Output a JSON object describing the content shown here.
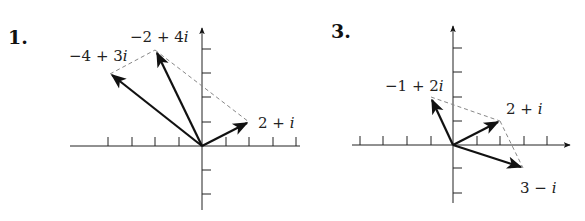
{
  "figures": [
    {
      "number": "1.",
      "origin_px": [
        202,
        146
      ],
      "unit_px": 23.5,
      "x_ticks": [
        -4,
        -3,
        -2,
        -1,
        1,
        2,
        3,
        4
      ],
      "y_ticks": [
        -2,
        -1,
        1,
        2,
        3,
        4
      ],
      "vectors": [
        {
          "re": 2,
          "im": 1,
          "label_main": "2 + ",
          "label_i": "i"
        },
        {
          "re": -4,
          "im": 3,
          "label_main": "−4 + 3",
          "label_i": "i"
        },
        {
          "re": -2,
          "im": 4,
          "label_main": "−2 + 4",
          "label_i": "i"
        }
      ],
      "dashed": [
        [
          [
            -4,
            3
          ],
          [
            -2,
            4
          ]
        ],
        [
          [
            -2,
            4
          ],
          [
            2,
            1
          ]
        ]
      ]
    },
    {
      "number": "3.",
      "origin_px": [
        453,
        145
      ],
      "unit_px": 23.5,
      "x_ticks": [
        -4,
        -3,
        -2,
        -1,
        1,
        2,
        3,
        4
      ],
      "y_ticks": [
        -2,
        -1,
        1,
        2,
        3,
        4
      ],
      "vectors": [
        {
          "re": -1,
          "im": 2,
          "label_main": "−1 + 2",
          "label_i": "i"
        },
        {
          "re": 2,
          "im": 1,
          "label_main": "2 + ",
          "label_i": "i"
        },
        {
          "re": 3,
          "im": -1,
          "label_main": "3 − ",
          "label_i": "i"
        }
      ],
      "dashed": [
        [
          [
            -1,
            2
          ],
          [
            2,
            1
          ]
        ],
        [
          [
            2,
            1
          ],
          [
            3,
            -1
          ]
        ]
      ]
    }
  ]
}
